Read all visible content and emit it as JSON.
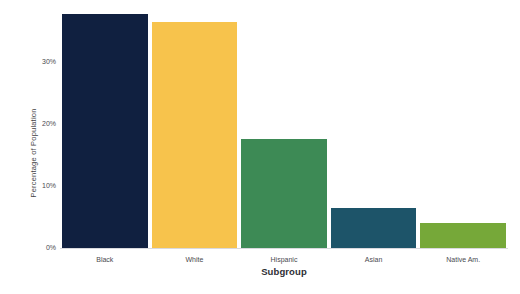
{
  "chart_data": {
    "type": "bar",
    "title": "",
    "subtitle": "",
    "xlabel": "Subgroup",
    "ylabel": "Percentage of Population",
    "categories": [
      "Black",
      "White",
      "Hispanic",
      "Asian",
      "Native Am."
    ],
    "values": [
      37.7,
      36.5,
      17.6,
      6.5,
      4.0
    ],
    "value_labels": [
      "",
      "",
      "",
      "",
      ""
    ],
    "ytick_labels": [
      "0%",
      "10%",
      "20%",
      "30%"
    ],
    "ytick_values": [
      0,
      10,
      20,
      30
    ],
    "ylim": [
      0,
      38.7
    ],
    "xtick_labels": [
      "Black",
      "White",
      "Hispanic",
      "Asian",
      "Native Am."
    ],
    "grid": false,
    "legend": null,
    "legend_position": "none",
    "bar_colors": [
      "#102040",
      "#F7C34C",
      "#3D8A55",
      "#1D5469",
      "#76A839"
    ],
    "background_color": "#FFFFFF",
    "axis_color": "#D9D9DE",
    "tick_label_color": "#4A4A50",
    "axis_title_color": "#2E2E34"
  }
}
